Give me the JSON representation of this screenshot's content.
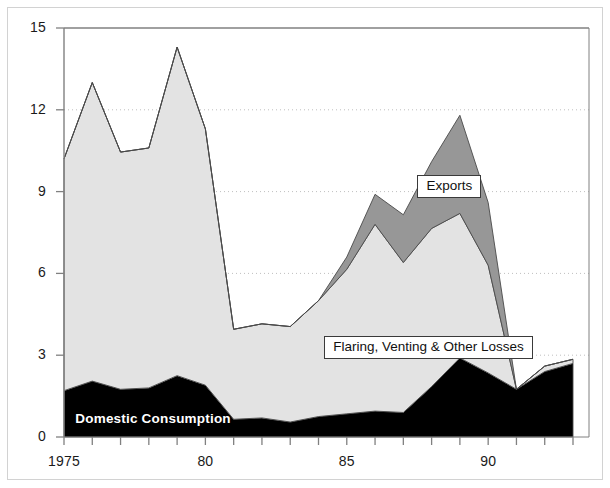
{
  "chart_data": {
    "type": "area",
    "stacked": true,
    "title": "",
    "subtitle": "",
    "xlabel": "",
    "ylabel": "",
    "xlim": [
      1975,
      1993
    ],
    "ylim": [
      0,
      15
    ],
    "yticks": [
      0,
      3,
      6,
      9,
      12,
      15
    ],
    "ytick_labels": [
      "0",
      "3",
      "6",
      "9",
      "12",
      "15"
    ],
    "xticks": [
      1975,
      1976,
      1977,
      1978,
      1979,
      1980,
      1981,
      1982,
      1983,
      1984,
      1985,
      1986,
      1987,
      1988,
      1989,
      1990,
      1991,
      1992,
      1993
    ],
    "xtick_labels_shown": [
      {
        "x": 1975,
        "label": "1975"
      },
      {
        "x": 1980,
        "label": "80"
      },
      {
        "x": 1985,
        "label": "85"
      },
      {
        "x": 1990,
        "label": "90"
      }
    ],
    "x": [
      1975,
      1976,
      1977,
      1978,
      1979,
      1980,
      1981,
      1982,
      1983,
      1984,
      1985,
      1986,
      1987,
      1988,
      1989,
      1990,
      1991,
      1992,
      1993
    ],
    "grid": "horizontal-dotted",
    "legend_position": "inline-annotations",
    "series": [
      {
        "name": "Domestic Consumption",
        "color": "#000000",
        "label_style": "white-bold-on-fill",
        "values": [
          1.7,
          2.05,
          1.75,
          1.8,
          2.25,
          1.9,
          0.65,
          0.7,
          0.55,
          0.75,
          0.85,
          0.95,
          0.9,
          1.85,
          2.9,
          2.35,
          1.75,
          2.4,
          2.7
        ]
      },
      {
        "name": "Flaring, Venting & Other Losses",
        "color": "#e3e3e3",
        "label_style": "boxed",
        "values": [
          8.5,
          10.95,
          8.7,
          8.8,
          12.05,
          9.4,
          3.3,
          3.45,
          3.5,
          4.25,
          5.3,
          6.85,
          5.5,
          5.8,
          5.3,
          3.95,
          0.0,
          0.2,
          0.15
        ]
      },
      {
        "name": "Exports",
        "color": "#979797",
        "label_style": "boxed",
        "values": [
          0,
          0,
          0,
          0,
          0,
          0,
          0,
          0,
          0,
          0,
          0.45,
          1.1,
          1.75,
          2.45,
          3.6,
          2.3,
          0.0,
          0.0,
          0.0
        ]
      }
    ],
    "totals": [
      10.2,
      13.0,
      10.45,
      10.6,
      14.3,
      11.3,
      3.95,
      4.15,
      4.05,
      5.0,
      6.6,
      8.9,
      8.15,
      10.1,
      11.8,
      8.6,
      1.75,
      2.6,
      2.85
    ],
    "annotations": [
      {
        "name": "Exports",
        "text": "Exports",
        "x": 1987.5,
        "y": 9.2
      },
      {
        "name": "Flaring, Venting & Other Losses",
        "text": "Flaring, Venting & Other Losses",
        "x": 1984.2,
        "y": 3.3
      },
      {
        "name": "Domestic Consumption",
        "text": "Domestic Consumption",
        "x": 1975.4,
        "y": 0.55
      }
    ]
  },
  "axis": {
    "y_labels": [
      "15",
      "12",
      "9",
      "6",
      "3",
      "0"
    ],
    "x_labels": [
      "1975",
      "80",
      "85",
      "90"
    ]
  },
  "labels": {
    "exports": "Exports",
    "flaring": "Flaring, Venting & Other Losses",
    "domestic": "Domestic Consumption"
  },
  "colors": {
    "domestic_consumption": "#000000",
    "flaring": "#e3e3e3",
    "exports": "#979797",
    "axis": "#808080",
    "grid": "#bfbfbf",
    "frame": "#d2d2d2",
    "text": "#1a1a1a"
  }
}
